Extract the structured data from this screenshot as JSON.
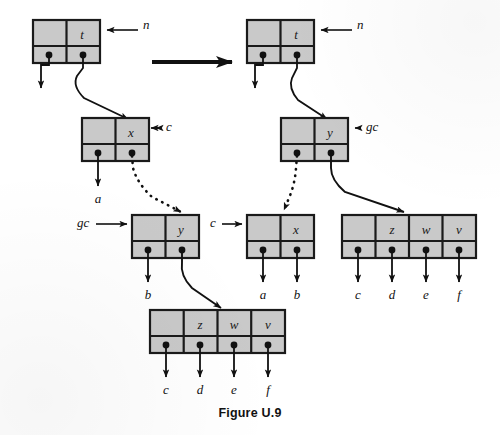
{
  "figure": {
    "caption": "Figure U.9",
    "style": {
      "node_fill": "#c9c9c9",
      "node_stroke": "#1a1a1a",
      "line_color": "#111111",
      "background": "#ffffff"
    }
  },
  "panels": [
    {
      "id": "before",
      "name": "before-state",
      "nodes": [
        {
          "id": "before-t",
          "label": "t",
          "cells": [
            "",
            "t"
          ],
          "x": 33,
          "y": 20,
          "w": 67,
          "h": 43
        },
        {
          "id": "before-x",
          "label": "x",
          "cells": [
            "",
            "x"
          ],
          "x": 82,
          "y": 118,
          "w": 67,
          "h": 43
        },
        {
          "id": "before-y",
          "label": "y",
          "cells": [
            "",
            "y"
          ],
          "x": 132,
          "y": 215,
          "w": 67,
          "h": 43
        },
        {
          "id": "before-zwv",
          "label": "z w v",
          "cells": [
            "",
            "z",
            "w",
            "v"
          ],
          "x": 150,
          "y": 310,
          "w": 135,
          "h": 43
        }
      ],
      "pointer_labels": [
        {
          "id": "before-n",
          "text": "n",
          "x": 143,
          "y": 26
        },
        {
          "id": "before-c",
          "text": "c",
          "x": 166,
          "y": 124
        },
        {
          "id": "before-gc",
          "text": "gc",
          "x": 77,
          "y": 220
        }
      ],
      "leaf_labels": [
        {
          "id": "before-a",
          "text": "a",
          "x": 98,
          "y": 203
        },
        {
          "id": "before-b",
          "text": "b",
          "x": 147,
          "y": 299
        },
        {
          "id": "before-c-leaf",
          "text": "c",
          "x": 164,
          "y": 394
        },
        {
          "id": "before-d-leaf",
          "text": "d",
          "x": 198,
          "y": 394
        },
        {
          "id": "before-e-leaf",
          "text": "e",
          "x": 232,
          "y": 394
        },
        {
          "id": "before-f-leaf",
          "text": "f",
          "x": 265,
          "y": 394
        }
      ]
    },
    {
      "id": "after",
      "name": "after-state",
      "nodes": [
        {
          "id": "after-t",
          "label": "t",
          "cells": [
            "",
            "t"
          ],
          "x": 247,
          "y": 20,
          "w": 67,
          "h": 43
        },
        {
          "id": "after-y",
          "label": "y",
          "cells": [
            "",
            "y"
          ],
          "x": 281,
          "y": 118,
          "w": 67,
          "h": 43
        },
        {
          "id": "after-x",
          "label": "x",
          "cells": [
            "",
            "x"
          ],
          "x": 247,
          "y": 215,
          "w": 67,
          "h": 43
        },
        {
          "id": "after-zwv",
          "label": "z w v",
          "cells": [
            "",
            "z",
            "w",
            "v"
          ],
          "x": 342,
          "y": 215,
          "w": 134,
          "h": 43
        }
      ],
      "pointer_labels": [
        {
          "id": "after-n",
          "text": "n",
          "x": 357,
          "y": 26
        },
        {
          "id": "after-gc",
          "text": "gc",
          "x": 366,
          "y": 124
        },
        {
          "id": "after-c",
          "text": "c",
          "x": 213,
          "y": 221
        }
      ],
      "leaf_labels": [
        {
          "id": "after-a-leaf",
          "text": "a",
          "x": 262,
          "y": 299
        },
        {
          "id": "after-b-leaf",
          "text": "b",
          "x": 296,
          "y": 299
        },
        {
          "id": "after-c-leaf",
          "text": "c",
          "x": 357,
          "y": 299
        },
        {
          "id": "after-d-leaf",
          "text": "d",
          "x": 391,
          "y": 299
        },
        {
          "id": "after-e-leaf",
          "text": "e",
          "x": 424,
          "y": 299
        },
        {
          "id": "after-f-leaf",
          "text": "f",
          "x": 457,
          "y": 299
        }
      ]
    }
  ],
  "transition_arrow": {
    "id": "transition-arrow",
    "from_x": 152,
    "to_x": 240,
    "y": 62
  }
}
